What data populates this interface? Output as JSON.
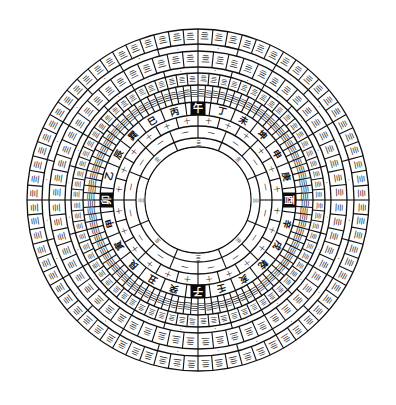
{
  "diagram": {
    "type": "luopan-compass",
    "center": [
      198,
      200
    ],
    "ring_radii": [
      171,
      156,
      149,
      133,
      127,
      115,
      98,
      85,
      74,
      62,
      53
    ],
    "rings": [
      {
        "name": "outer-cells-ring",
        "r_outer": 171,
        "r_inner": 156,
        "divisions": 72,
        "filler": "亖"
      },
      {
        "name": "outer-thin-ring",
        "r_outer": 156,
        "r_inner": 149,
        "divisions": 24,
        "filler": "・"
      },
      {
        "name": "second-cells-ring",
        "r_outer": 149,
        "r_inner": 133,
        "divisions": 60,
        "filler": "亖"
      },
      {
        "name": "second-thin-ring",
        "r_outer": 133,
        "r_inner": 127,
        "divisions": 24,
        "filler": "・"
      },
      {
        "name": "double-cells-ring",
        "r_outer": 127,
        "r_inner": 115,
        "divisions": 72,
        "filler": "亖"
      },
      {
        "name": "sub-mountain-ring",
        "r_outer": 115,
        "r_inner": 98,
        "divisions": 96,
        "filler": "亖"
      },
      {
        "name": "twenty-four-mountains-ring",
        "r_outer": 98,
        "r_inner": 85,
        "divisions": 24
      },
      {
        "name": "inner-ring-1",
        "r_outer": 85,
        "r_inner": 74,
        "divisions": 24,
        "filler": "十"
      },
      {
        "name": "inner-ring-2",
        "r_outer": 74,
        "r_inner": 62,
        "divisions": 16,
        "filler": "一"
      },
      {
        "name": "inner-ring-3",
        "r_outer": 62,
        "r_inner": 53,
        "divisions": 8,
        "filler": "亖"
      }
    ],
    "twenty_four_mountains": [
      "午",
      "丁",
      "未",
      "坤",
      "申",
      "庚",
      "酉",
      "辛",
      "戌",
      "乾",
      "亥",
      "壬",
      "子",
      "癸",
      "丑",
      "艮",
      "寅",
      "甲",
      "卯",
      "乙",
      "辰",
      "巽",
      "巳",
      "丙"
    ],
    "highlighted_cardinals": [
      "午",
      "酉",
      "子",
      "卯"
    ],
    "orientation_note": "午 at top, 酉 at right, 子 at bottom, 卯 at left, clockwise order",
    "colors": {
      "ink": "#111111",
      "paper": "#ffffff",
      "highlight_bg": "#0a0a0a",
      "highlight_text": "#ffffff"
    }
  }
}
